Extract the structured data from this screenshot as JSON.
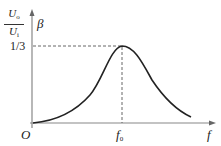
{
  "diagram": {
    "y_axis": {
      "label_fraction": {
        "numerator": "U",
        "numerator_sub": "o",
        "denominator": "U",
        "denominator_sub": "i"
      },
      "label_symbol": "β",
      "tick_label": "1/3"
    },
    "x_axis": {
      "label": "f",
      "tick_label": "f",
      "tick_label_sub": "0"
    },
    "origin_label": "O",
    "colors": {
      "axis": "#888888",
      "curve": "#222222",
      "guide": "#555555"
    }
  }
}
